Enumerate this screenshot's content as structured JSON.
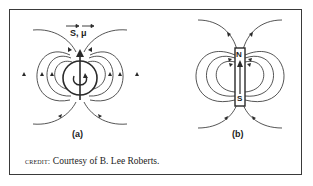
{
  "figure": {
    "panels": [
      {
        "id": "a",
        "label": "(a)",
        "subject": "spinning charged particle",
        "vector_labels": "S, μ",
        "vector_symbols": [
          "S",
          "μ"
        ]
      },
      {
        "id": "b",
        "label": "(b)",
        "subject": "bar magnet",
        "pole_top": "N",
        "pole_bottom": "S"
      }
    ],
    "credit": {
      "lead": "credit:",
      "text": "Courtesy of B. Lee Roberts."
    },
    "colors": {
      "line": "#2a2a2a",
      "border": "#3a3a3a",
      "background": "#ffffff"
    }
  }
}
